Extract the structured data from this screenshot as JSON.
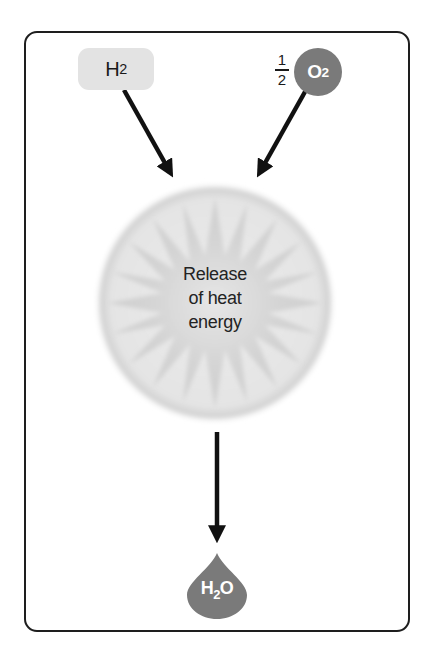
{
  "diagram": {
    "reactants": [
      {
        "id": "hydrogen",
        "label": "H",
        "subscript": "2",
        "shape": "rounded-rectangle",
        "fill": "#e3e3e3"
      },
      {
        "id": "oxygen",
        "coefficient_numerator": "1",
        "coefficient_denominator": "2",
        "label": "O",
        "subscript": "2",
        "shape": "circle",
        "fill": "#7a7a7a"
      }
    ],
    "reaction": {
      "label_lines": [
        "Release",
        "of heat",
        "energy"
      ],
      "shape": "starburst-in-circle",
      "fill": "#d9d9d9"
    },
    "product": {
      "id": "water",
      "label": "H",
      "subscript": "2",
      "suffix": "O",
      "shape": "droplet",
      "fill": "#7a7a7a"
    },
    "arrows": [
      {
        "from": "hydrogen",
        "to": "reaction"
      },
      {
        "from": "oxygen",
        "to": "reaction"
      },
      {
        "from": "reaction",
        "to": "water"
      }
    ],
    "colors": {
      "border": "#1e1e1e",
      "arrow": "#111111",
      "text": "#1a1a1a"
    }
  }
}
